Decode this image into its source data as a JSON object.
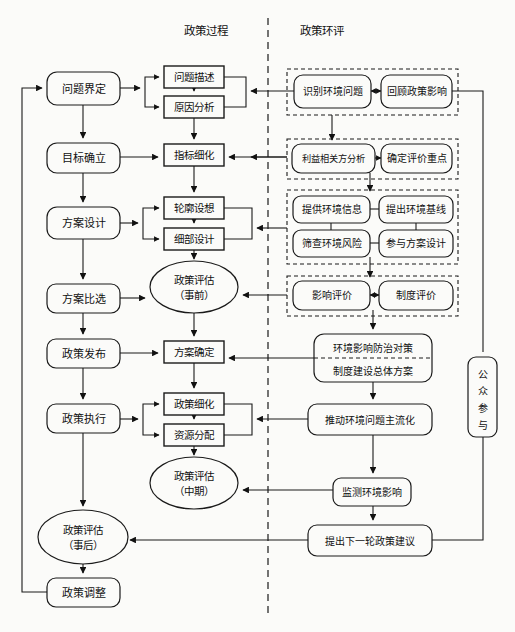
{
  "diagram": {
    "columns": {
      "policy_process_header": "政策过程",
      "policy_sea_header": "政策环评"
    },
    "colors": {
      "stroke": "#1a1a1a",
      "background": "#fbfbf9",
      "dashed_group": "#1a1a1a"
    }
  },
  "left_column": [
    {
      "id": "problem-definition",
      "label": "问题界定",
      "shape": "rounded-rect",
      "x": 47,
      "y": 72,
      "w": 73,
      "h": 33
    },
    {
      "id": "goal-setting",
      "label": "目标确立",
      "shape": "rounded-rect",
      "x": 47,
      "y": 143,
      "w": 73,
      "h": 30
    },
    {
      "id": "scheme-design",
      "label": "方案设计",
      "shape": "rounded-rect",
      "x": 47,
      "y": 207,
      "w": 73,
      "h": 32
    },
    {
      "id": "scheme-selection",
      "label": "方案比选",
      "shape": "rounded-rect",
      "x": 47,
      "y": 284,
      "w": 73,
      "h": 29
    },
    {
      "id": "policy-release",
      "label": "政策发布",
      "shape": "rounded-rect",
      "x": 47,
      "y": 339,
      "w": 73,
      "h": 29
    },
    {
      "id": "policy-execution",
      "label": "政策执行",
      "shape": "rounded-rect",
      "x": 47,
      "y": 404,
      "w": 73,
      "h": 29
    },
    {
      "id": "policy-adjustment",
      "label": "政策调整",
      "shape": "rounded-rect",
      "x": 47,
      "y": 578,
      "w": 73,
      "h": 29
    }
  ],
  "left_ellipse": {
    "id": "policy-eval-post",
    "line1": "政策评估",
    "line2": "（事后）",
    "cx": 83,
    "cy": 537,
    "rx": 45,
    "ry": 27
  },
  "middle_column": [
    {
      "id": "problem-description",
      "label": "问题描述",
      "x": 164,
      "y": 66,
      "w": 60,
      "h": 22
    },
    {
      "id": "cause-analysis",
      "label": "原因分析",
      "x": 164,
      "y": 96,
      "w": 60,
      "h": 22
    },
    {
      "id": "indicator-refine",
      "label": "指标细化",
      "x": 164,
      "y": 144,
      "w": 60,
      "h": 22
    },
    {
      "id": "outline-conception",
      "label": "轮廓设想",
      "x": 164,
      "y": 197,
      "w": 60,
      "h": 22
    },
    {
      "id": "detail-design",
      "label": "细部设计",
      "x": 164,
      "y": 228,
      "w": 60,
      "h": 22
    },
    {
      "id": "scheme-confirm",
      "label": "方案确定",
      "x": 164,
      "y": 341,
      "w": 60,
      "h": 22
    },
    {
      "id": "policy-refine",
      "label": "政策细化",
      "x": 164,
      "y": 393,
      "w": 60,
      "h": 22
    },
    {
      "id": "resource-allocation",
      "label": "资源分配",
      "x": 164,
      "y": 424,
      "w": 60,
      "h": 22
    }
  ],
  "middle_ellipses": [
    {
      "id": "policy-eval-pre",
      "line1": "政策评估",
      "line2": "（事前）",
      "cx": 194,
      "cy": 287,
      "rx": 44,
      "ry": 26
    },
    {
      "id": "policy-eval-mid",
      "line1": "政策评估",
      "line2": "（中期）",
      "cx": 194,
      "cy": 483,
      "rx": 44,
      "ry": 26
    }
  ],
  "sea_groups": [
    {
      "id": "group-identify",
      "x": 287,
      "y": 69,
      "w": 171,
      "h": 46,
      "boxes": [
        {
          "id": "identify-env-problem",
          "label": "识别环境问题",
          "x": 294,
          "y": 75,
          "w": 77,
          "h": 33
        },
        {
          "id": "review-policy-impact",
          "label": "回顾政策影响",
          "x": 381,
          "y": 75,
          "w": 71,
          "h": 33
        }
      ],
      "internal_connector": "double-arrow"
    },
    {
      "id": "group-scoping",
      "x": 287,
      "y": 139,
      "w": 171,
      "h": 40,
      "boxes": [
        {
          "id": "stakeholder-analysis",
          "label": "利益相关方分析",
          "x": 292,
          "y": 144,
          "w": 83,
          "h": 29
        },
        {
          "id": "determine-eval-focus",
          "label": "确定评价重点",
          "x": 381,
          "y": 144,
          "w": 71,
          "h": 29
        }
      ],
      "internal_connector": "arrow-right"
    },
    {
      "id": "group-assessment-inputs",
      "x": 287,
      "y": 190,
      "w": 171,
      "h": 74,
      "boxes": [
        {
          "id": "provide-env-info",
          "label": "提供环境信息",
          "x": 293,
          "y": 196,
          "w": 77,
          "h": 27
        },
        {
          "id": "propose-env-baseline",
          "label": "提出环境基线",
          "x": 379,
          "y": 196,
          "w": 74,
          "h": 27
        },
        {
          "id": "screen-env-risk",
          "label": "筛查环境风险",
          "x": 293,
          "y": 230,
          "w": 77,
          "h": 27
        },
        {
          "id": "join-scheme-design",
          "label": "参与方案设计",
          "x": 379,
          "y": 230,
          "w": 74,
          "h": 27
        }
      ],
      "internal_connector": "plain-links"
    },
    {
      "id": "group-evaluation",
      "x": 287,
      "y": 276,
      "w": 171,
      "h": 40,
      "boxes": [
        {
          "id": "impact-evaluation",
          "label": "影响评价",
          "x": 293,
          "y": 281,
          "w": 77,
          "h": 29
        },
        {
          "id": "institution-evaluation",
          "label": "制度评价",
          "x": 379,
          "y": 281,
          "w": 74,
          "h": 29
        }
      ],
      "internal_connector": "double-arrow"
    }
  ],
  "sea_boxes": [
    {
      "id": "env-impact-countermeasure",
      "line1": "环境影响防治对策",
      "line2": "制度建设总体方案",
      "x": 314,
      "y": 334,
      "w": 118,
      "h": 48,
      "divider": "dashed"
    },
    {
      "id": "mainstream-env-issue",
      "label": "推动环境问题主流化",
      "x": 308,
      "y": 404,
      "w": 124,
      "h": 31
    },
    {
      "id": "monitor-env-impact",
      "label": "监测环境影响",
      "x": 333,
      "y": 478,
      "w": 78,
      "h": 28
    },
    {
      "id": "propose-next-policy",
      "label": "提出下一轮政策建议",
      "x": 308,
      "y": 525,
      "w": 124,
      "h": 31
    }
  ],
  "public_participation": {
    "id": "public-participation",
    "chars": [
      "公",
      "众",
      "参",
      "与"
    ],
    "x": 468,
    "y": 357,
    "w": 29,
    "h": 80
  },
  "divider": {
    "id": "vertical-dashed-divider",
    "x": 268,
    "y_top": 18,
    "y_bottom": 615
  }
}
